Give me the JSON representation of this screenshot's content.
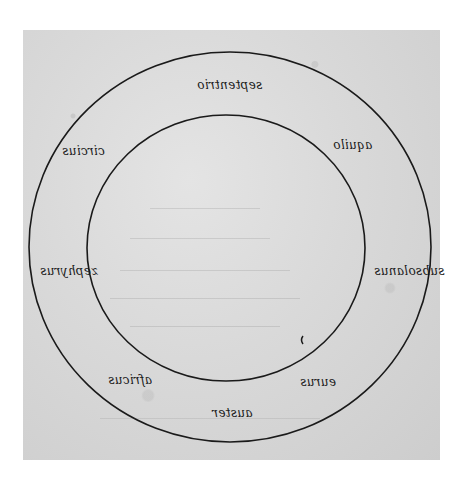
{
  "diagram": {
    "type": "concentric-circles",
    "colors": {
      "parchment": "#d9d9d9",
      "ink": "#1a1a1a",
      "background": "#ffffff"
    },
    "outer_circle": {
      "cx": 230,
      "cy": 247,
      "rx": 201,
      "ry": 195
    },
    "inner_circle": {
      "cx": 226,
      "cy": 248,
      "rx": 139,
      "ry": 133
    },
    "labels": [
      {
        "id": "top",
        "text": "septentrio"
      },
      {
        "id": "top-right",
        "text": "aquilo"
      },
      {
        "id": "right",
        "text": "subsolanus"
      },
      {
        "id": "bottom-right",
        "text": "eurus"
      },
      {
        "id": "bottom",
        "text": "auster"
      },
      {
        "id": "bottom-left",
        "text": "africus"
      },
      {
        "id": "left",
        "text": "zephyrus"
      },
      {
        "id": "top-left",
        "text": "circius"
      }
    ],
    "faint_text_lines": [
      "",
      "",
      "",
      "",
      "",
      ""
    ]
  }
}
